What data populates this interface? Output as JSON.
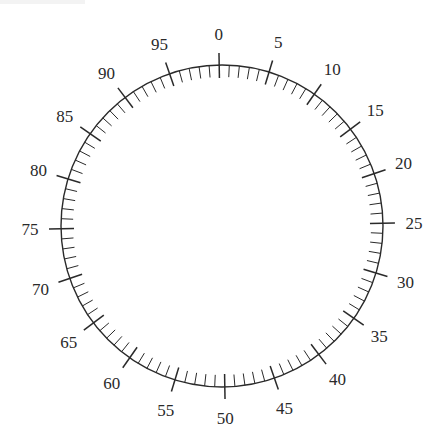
{
  "dial": {
    "type": "circular-scale",
    "divisions": 100,
    "major_every": 5,
    "labels": [
      "0",
      "5",
      "10",
      "15",
      "20",
      "25",
      "30",
      "35",
      "40",
      "45",
      "50",
      "55",
      "60",
      "65",
      "70",
      "75",
      "80",
      "85",
      "90",
      "95"
    ],
    "center": [
      222,
      226
    ],
    "radius": 161,
    "rotation_deg": -1,
    "minor_tick_length": 12,
    "major_tick_inner": 13,
    "major_tick_outer": 12,
    "label_radius": 192,
    "colors": {
      "line": "#2a2a2a",
      "background": "#ffffff"
    }
  }
}
